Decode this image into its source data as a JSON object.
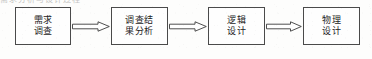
{
  "diagram": {
    "type": "flowchart",
    "orientation": "left-to-right",
    "partial_text_above": "需求分析与设计过程",
    "nodes": [
      {
        "id": "requirement-survey",
        "lines": [
          "需求",
          "调查"
        ],
        "x": 15,
        "y": 7,
        "width": 56,
        "height": 38
      },
      {
        "id": "survey-result-analysis",
        "lines": [
          "调查结",
          "果分析"
        ],
        "x": 111,
        "y": 7,
        "width": 57,
        "height": 38
      },
      {
        "id": "logical-design",
        "lines": [
          "逻辑",
          "设计"
        ],
        "x": 208,
        "y": 7,
        "width": 57,
        "height": 38
      },
      {
        "id": "physical-design",
        "lines": [
          "物理",
          "设计"
        ],
        "x": 303,
        "y": 7,
        "width": 57,
        "height": 38
      }
    ],
    "arrows": [
      {
        "id": "arrow-1",
        "from": "requirement-survey",
        "to": "survey-result-analysis",
        "x": 72,
        "y": 21,
        "width": 38
      },
      {
        "id": "arrow-2",
        "from": "survey-result-analysis",
        "to": "logical-design",
        "x": 169,
        "y": 21,
        "width": 38
      },
      {
        "id": "arrow-3",
        "from": "logical-design",
        "to": "physical-design",
        "x": 266,
        "y": 21,
        "width": 36
      }
    ]
  },
  "colors": {
    "background": "#fdfdfc",
    "node_border": "#4a4a4a",
    "node_fill": "#fefefe",
    "text": "#1c1c1c",
    "arrow_stroke": "#3c3c3c"
  }
}
